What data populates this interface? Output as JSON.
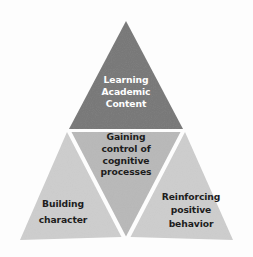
{
  "figure": {
    "type": "pyramid-diagram",
    "title": "",
    "background_color": "#fdfdfd",
    "separator_color": "#ffffff",
    "apex": [
      126,
      21
    ],
    "base_left": [
      20,
      240
    ],
    "base_right": [
      233,
      240
    ]
  },
  "segments": {
    "top": {
      "name": "learning-academic-content",
      "text": "Learning\nAcademic\nContent",
      "fill_color": "#777777",
      "text_color": "#ffffff",
      "position": "apex"
    },
    "middle": {
      "name": "gaining-control-of-cognitive-processes",
      "text": "Gaining\ncontrol of\ncognitive\nprocesses",
      "fill_color": "#b8b8b8",
      "text_color": "#1d1d1d",
      "position": "center-inverted"
    },
    "bottom_left": {
      "name": "building-character",
      "text": "Building\ncharacter",
      "fill_color": "#cdcdcd",
      "text_color": "#1d1d1d",
      "position": "bottom-left"
    },
    "bottom_right": {
      "name": "reinforcing-positive-behavior",
      "text": "Reinforcing\npositive\nbehavior",
      "fill_color": "#cdcdcd",
      "text_color": "#1d1d1d",
      "position": "bottom-right"
    }
  }
}
